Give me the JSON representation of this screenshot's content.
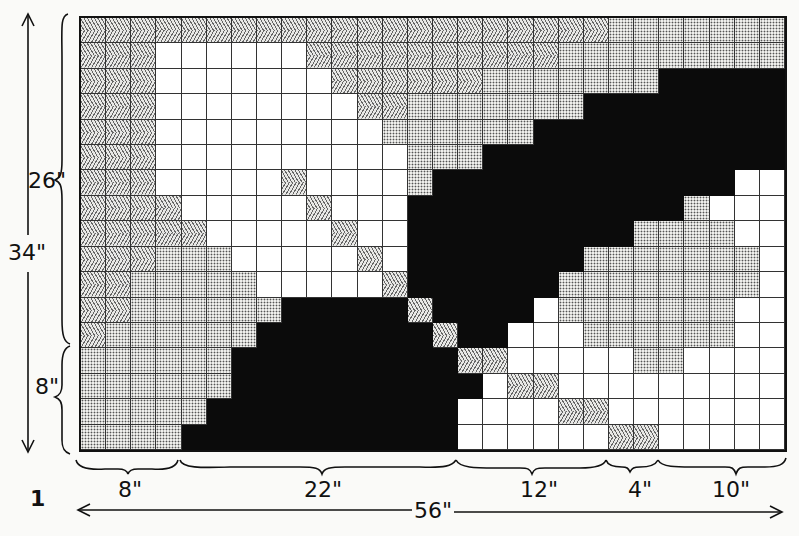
{
  "figure": {
    "number": "1",
    "legend": {
      "Z": "chevron-hatched",
      "D": "dotted",
      "W": "white",
      "B": "black"
    },
    "colors": {
      "black": "#0b0b0b",
      "white": "#ffffff",
      "dot": "#efefec",
      "chevron": "#e8e8e6",
      "line": "#111111"
    },
    "grid": {
      "columns": 28,
      "rows": 17,
      "cells": [
        "ZZZZZZZZZZZZZZZZZZZZZDDDDDDD",
        "ZZZWWWWWWZZZZZZZZZZDDDDDDDDD",
        "ZZZWWWWWWWZZZZZZDDDDDDDBBBBB",
        "ZZZWWWWWWWWZZDDDDDDDBBBBBBBB",
        "ZZZWWWWWWWWWDDDDDDBBBBBBBBBB",
        "ZZZWWWWWWWWWWDDDBBBBBBBBBBBB",
        "ZZZWWWWWZWWWWDBBBBBBBBBBBBWW",
        "ZZZZWWWWWZWWWBBBBBBBBBBBDWWW",
        "ZZZZZWWWWWZWWBBBBBBBBBDDDDWW",
        "ZZZDDDWWWWWZWBBBBBBBDDDDDDDW",
        "ZZDDDDDWWWWWZBBBBBBDDDDDDDDW",
        "ZZDDDDDDBBBBBZBBBBWDDDDDDDWW",
        "ZDDDDDDBBBBBBBZBBWWWDDDDDDWW",
        "DDDDDDBBBBBBBBBZZWWWWWDDWWWW",
        "DDDDDDBBBBBBBBBBWZZWWWWWWWWW",
        "DDDDDBBBBBBBBBBWWWWZZWWWWWWW",
        "DDDDBBBBBBBBBBBWWWWWWZZWWWWW"
      ]
    },
    "dimensions": {
      "height_total": "34\"",
      "height_parts": [
        "26\"",
        "8\""
      ],
      "width_total": "56\"",
      "width_parts": [
        "8\"",
        "22\"",
        "12\"",
        "4\"",
        "10\""
      ],
      "width_parts_columns": [
        4,
        11,
        6,
        2,
        5
      ],
      "height_parts_rows": [
        13,
        4
      ]
    }
  }
}
